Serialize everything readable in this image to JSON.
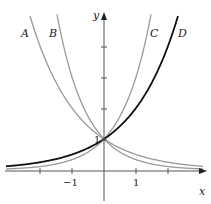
{
  "chart_data": {
    "type": "line",
    "title": "",
    "xlabel": "x",
    "ylabel": "y",
    "x_ticks": [
      -2,
      -1,
      0,
      1,
      2
    ],
    "x_tick_labels": [
      "-1",
      "1"
    ],
    "y_tick_labels": [
      "1"
    ],
    "y_ticks": [
      1,
      2,
      3,
      4
    ],
    "xlim": [
      -3.2,
      3.2
    ],
    "ylim": [
      -0.9,
      5.3
    ],
    "grid": false,
    "series": [
      {
        "name": "A",
        "formula": "(1/2)^x",
        "base": 0.5,
        "color": "#999999",
        "width": 1.3
      },
      {
        "name": "B",
        "formula": "(1/3)^x",
        "base": 0.3333,
        "color": "#999999",
        "width": 1.3
      },
      {
        "name": "C",
        "formula": "3^x",
        "base": 3,
        "color": "#999999",
        "width": 1.3
      },
      {
        "name": "D",
        "formula": "2^x",
        "base": 2,
        "color": "#111111",
        "width": 1.8
      }
    ]
  },
  "labels": {
    "A": "A",
    "B": "B",
    "C": "C",
    "D": "D",
    "x": "x",
    "y": "y",
    "neg1": "−1",
    "pos1": "1",
    "one": "1"
  }
}
